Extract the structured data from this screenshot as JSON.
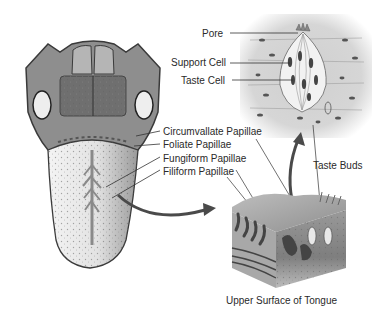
{
  "diagram": {
    "labels": {
      "pore": "Pore",
      "support_cell": "Support Cell",
      "taste_cell": "Taste Cell",
      "circumvallate": "Circumvallate Papillae",
      "foliate": "Foliate  Papillae",
      "fungiform": "Fungiform Papillae",
      "filiform": "Filiform Papillae",
      "taste_buds": "Taste Buds",
      "upper_surface": "Upper Surface of Tongue"
    },
    "panels": [
      "tongue-overview",
      "taste-bud-closeup",
      "tongue-surface-cross-section"
    ],
    "colors": {
      "tongue_outline": "#3a3a3a",
      "tongue_body": "#b8b8b8",
      "tongue_front": "#e6e6e6",
      "arrow": "#4a4a4a",
      "closeup_bg": "#d0d0d0",
      "text": "#2a2a2a"
    }
  }
}
